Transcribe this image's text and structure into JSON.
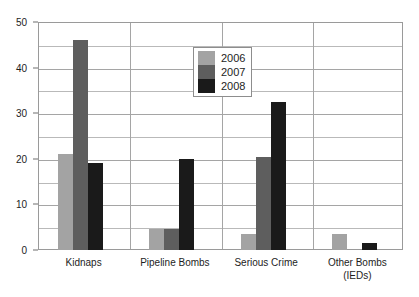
{
  "chart_data": {
    "type": "bar",
    "title": "",
    "subtitle": "",
    "xlabel": "",
    "ylabel": "",
    "ylim": [
      0,
      50
    ],
    "yticks": [
      0,
      10,
      20,
      30,
      40,
      50
    ],
    "yticklabels": [
      "0",
      "10",
      "20",
      "30",
      "40",
      "50"
    ],
    "minor_gridlines": [
      5,
      15,
      25,
      35,
      45
    ],
    "grid": true,
    "legend_position": "upper center",
    "categories": [
      "Kidnaps",
      "Pipeline Bombs",
      "Serious Crime",
      "Other Bombs\n(IEDs)"
    ],
    "series": [
      {
        "name": "2006",
        "color": "#a3a3a3",
        "values": [
          21,
          4.5,
          3.5,
          3.5
        ]
      },
      {
        "name": "2007",
        "color": "#5e5e5e",
        "values": [
          46,
          4.5,
          20.5,
          0
        ]
      },
      {
        "name": "2008",
        "color": "#1a1a1a",
        "values": [
          19,
          20,
          32.5,
          1.5
        ]
      }
    ]
  },
  "legend": {
    "entries": [
      {
        "label": "2006"
      },
      {
        "label": "2007"
      },
      {
        "label": "2008"
      }
    ]
  },
  "axis": {
    "y_labels": [
      "50",
      "40",
      "30",
      "20",
      "10",
      "0"
    ]
  },
  "colors": {
    "series_2006": "#a3a3a3",
    "series_2007": "#5e5e5e",
    "series_2008": "#1a1a1a",
    "gridline": "#b9b9b9",
    "axis_line": "#9a9a9a",
    "text": "#1d1d1d",
    "background": "#ffffff"
  }
}
